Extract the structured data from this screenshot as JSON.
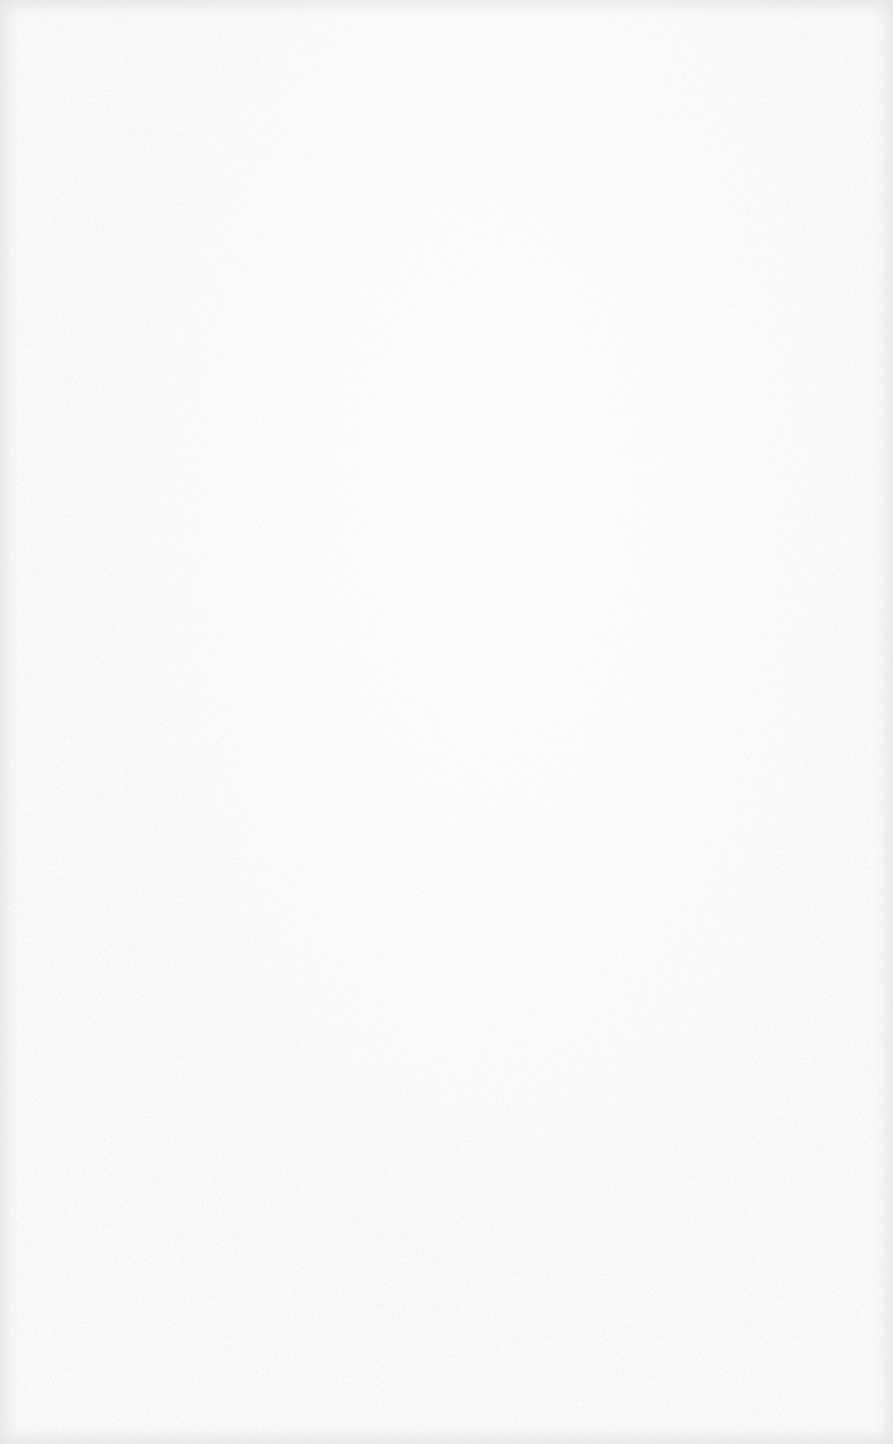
{
  "surface": {
    "type": "blank-textured-paper",
    "base_color": "#fafafa",
    "border_color": "#e6e6e6",
    "speckle_color": "#d4d4d4",
    "text_content": []
  }
}
